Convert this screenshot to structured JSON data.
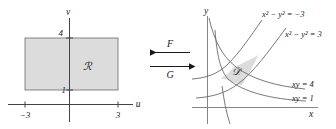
{
  "figure": {
    "stroke_color": "#555555",
    "axis_color": "#444444",
    "fill_color": "#dcdcdc",
    "text_color": "#1a1a1a"
  },
  "left_panel": {
    "name": "uv-plane",
    "axis_labels": {
      "horizontal": "u",
      "vertical": "v"
    },
    "tick_labels": {
      "u_negative": "−3",
      "u_positive": "3",
      "v_top": "4",
      "v_bottom": "1"
    },
    "region_label": "ℛ",
    "rectangle": {
      "u_min": -3,
      "u_max": 3,
      "v_min": 1,
      "v_max": 4
    }
  },
  "arrows": {
    "top": {
      "label": "F",
      "direction": "left"
    },
    "bottom": {
      "label": "G",
      "direction": "right"
    }
  },
  "right_panel": {
    "name": "xy-plane",
    "axis_labels": {
      "horizontal": "x",
      "vertical": "y"
    },
    "region_label": "𝒟",
    "curve_labels": [
      "x² − y² = −3",
      "x² − y² = 3",
      "xy = 4",
      "xy = 1"
    ],
    "curves": [
      {
        "equation": "x^2-y^2=-3",
        "value": -3
      },
      {
        "equation": "x^2-y^2=3",
        "value": 3
      },
      {
        "equation": "xy=4",
        "value": 4
      },
      {
        "equation": "xy=1",
        "value": 1
      }
    ]
  }
}
